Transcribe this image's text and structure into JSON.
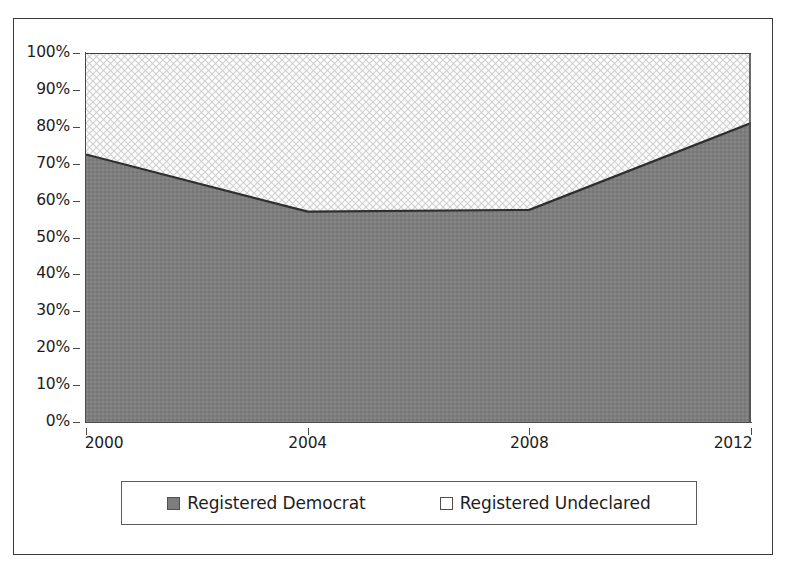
{
  "chart_data": {
    "type": "area",
    "title": "",
    "subtitle": "",
    "xlabel": "",
    "ylabel": "",
    "stacked": "100%",
    "grid": false,
    "legend_position": "bottom",
    "x": [
      2000,
      2004,
      2008,
      2012
    ],
    "categories": [
      "2000",
      "2004",
      "2008",
      "2012"
    ],
    "xtick_labels": [
      "2000",
      "2004",
      "2008",
      "2012"
    ],
    "ytick_labels": [
      "100%",
      "90%",
      "80%",
      "70%",
      "60%",
      "50%",
      "40%",
      "30%",
      "20%",
      "10%",
      "0%"
    ],
    "ytick_values": [
      100,
      90,
      80,
      70,
      60,
      50,
      40,
      30,
      20,
      10,
      0
    ],
    "ylim": [
      0,
      100
    ],
    "xlim": [
      2000,
      2012
    ],
    "series": [
      {
        "name": "Registered Democrat",
        "values": [
          72.5,
          57.0,
          57.5,
          81.0
        ],
        "color": "#7d7d7d",
        "fill": "solid-gray"
      },
      {
        "name": "Registered Undeclared",
        "values": [
          27.5,
          43.0,
          42.5,
          19.0
        ],
        "color": "#f2f2f2",
        "fill": "light-crosshatch"
      }
    ]
  },
  "legend": {
    "entries": [
      {
        "label": "Registered Democrat",
        "swatch": "filled-gray-square"
      },
      {
        "label": "Registered Undeclared",
        "swatch": "empty-white-square"
      }
    ]
  },
  "axes": {
    "y": {
      "ticks": [
        {
          "label": "100%",
          "value": 100
        },
        {
          "label": "90%",
          "value": 90
        },
        {
          "label": "80%",
          "value": 80
        },
        {
          "label": "70%",
          "value": 70
        },
        {
          "label": "60%",
          "value": 60
        },
        {
          "label": "50%",
          "value": 50
        },
        {
          "label": "40%",
          "value": 40
        },
        {
          "label": "30%",
          "value": 30
        },
        {
          "label": "20%",
          "value": 20
        },
        {
          "label": "10%",
          "value": 10
        },
        {
          "label": "0%",
          "value": 0
        }
      ]
    },
    "x": {
      "ticks": [
        {
          "label": "2000",
          "value": 2000
        },
        {
          "label": "2004",
          "value": 2004
        },
        {
          "label": "2008",
          "value": 2008
        },
        {
          "label": "2012",
          "value": 2012
        }
      ]
    }
  },
  "colors": {
    "series_democrat": "#7d7d7d",
    "series_undeclared": "#f5f5f5",
    "axis": "#4a4a4a",
    "text": "#1d1d1d",
    "frame": "#3a3a3a"
  }
}
